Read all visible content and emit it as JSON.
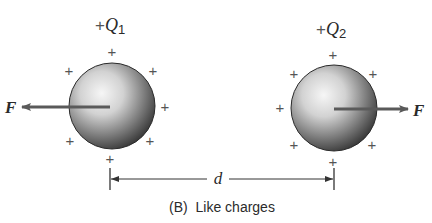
{
  "diagram": {
    "caption": "(B)  Like charges",
    "charges": [
      {
        "label_prefix": "+",
        "label_symbol": "Q",
        "label_subscript": "1",
        "sign": "+"
      },
      {
        "label_prefix": "+",
        "label_symbol": "Q",
        "label_subscript": "2",
        "sign": "+"
      }
    ],
    "force_left_label": "F",
    "force_right_label": "F",
    "distance_label": "d",
    "plus_sign": "+",
    "colors": {
      "ink": "#2a2a2a",
      "arrow": "#5a5a5a",
      "sphere_light": "#f4f4f4",
      "sphere_dark": "#3a3a3a"
    }
  }
}
